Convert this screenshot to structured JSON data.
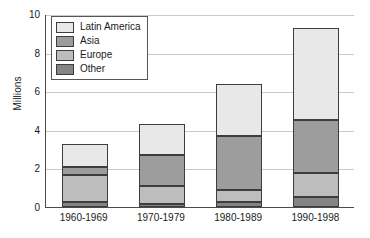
{
  "chart_data": {
    "type": "bar",
    "subtype": "stacked-bar",
    "title": "",
    "xlabel": "",
    "ylabel": "Millions",
    "ylim": [
      0,
      10
    ],
    "yticks": [
      "0",
      "2",
      "4",
      "6",
      "8",
      "10"
    ],
    "grid": true,
    "legend_position": "top-left",
    "categories": [
      "1960-1969",
      "1970-1979",
      "1980-1989",
      "1990-1998"
    ],
    "series": [
      {
        "name": "Other",
        "color": "#848484",
        "values": [
          0.28,
          0.15,
          0.28,
          0.5
        ]
      },
      {
        "name": "Europe",
        "color": "#bdbdbd",
        "values": [
          1.39,
          0.92,
          0.62,
          1.27
        ]
      },
      {
        "name": "Asia",
        "color": "#9d9d9d",
        "values": [
          0.38,
          1.63,
          2.8,
          2.73
        ]
      },
      {
        "name": "Latin America",
        "color": "#e8e8e8",
        "values": [
          1.2,
          1.6,
          2.65,
          4.8
        ]
      }
    ],
    "cumulative_tops": [
      [
        0.28,
        1.67,
        2.05,
        3.25
      ],
      [
        0.15,
        1.07,
        2.7,
        4.3
      ],
      [
        0.28,
        0.9,
        3.7,
        6.35
      ],
      [
        0.5,
        1.77,
        4.5,
        9.3
      ]
    ],
    "totals": [
      3.25,
      4.3,
      6.35,
      9.3
    ]
  },
  "legend": {
    "items": [
      {
        "label": "Latin America",
        "color": "#e8e8e8"
      },
      {
        "label": "Asia",
        "color": "#9d9d9d"
      },
      {
        "label": "Europe",
        "color": "#bdbdbd"
      },
      {
        "label": "Other",
        "color": "#848484"
      }
    ]
  },
  "axes": {
    "y_title": "Millions"
  }
}
